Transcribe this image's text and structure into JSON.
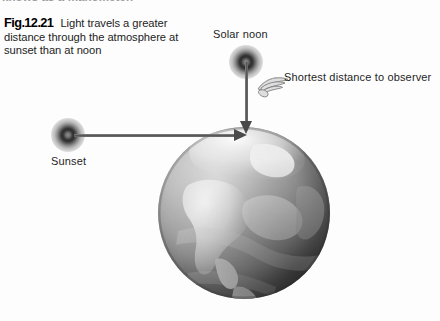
{
  "page": {
    "background_color": "#fdfdfd",
    "cutoff_top_line": "knows as a manometer."
  },
  "caption": {
    "figure_number": "Fig.12.21",
    "text": "Light travels a greater distance through the atmosphere at sunset than at noon"
  },
  "diagram": {
    "labels": {
      "sunset": "Sunset",
      "solar_noon": "Solar noon",
      "shortest_distance": "Shortest distance to observer"
    },
    "icons": {
      "sun_sunset": "sun-icon",
      "sun_noon": "sun-icon",
      "pointer": "pointing-hand-icon",
      "globe": "earth-globe-icon"
    },
    "colors": {
      "ray": "#4a4a4a",
      "text": "#1f1f1f",
      "globe_light": "#c9c9c9",
      "globe_dark": "#464646"
    },
    "rays": [
      {
        "name": "sunset-ray",
        "from": "Sunset",
        "direction": "horizontal",
        "target": "observer point on globe"
      },
      {
        "name": "solar-noon-ray",
        "from": "Solar noon",
        "direction": "vertical",
        "target": "observer point on globe"
      }
    ]
  }
}
